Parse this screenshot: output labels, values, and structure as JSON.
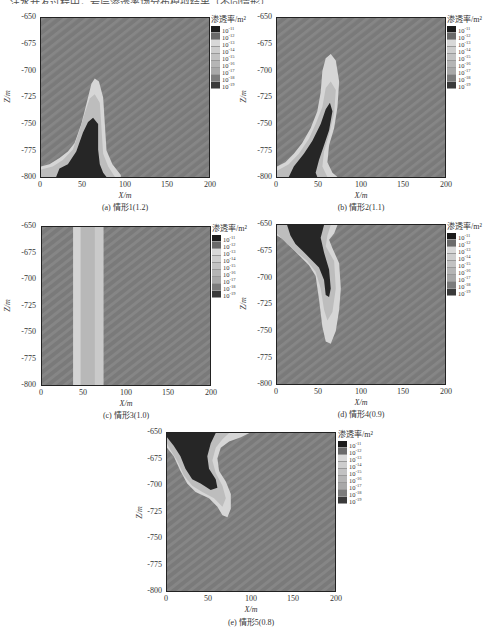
{
  "topline": "…注水开发过程中，岩层渗透率场分布模拟结果（不同情形）…",
  "legend": {
    "title": "渗透率/m²",
    "levels": [
      {
        "label": "10",
        "exp": "-11",
        "color": "#1c1c1c"
      },
      {
        "label": "10",
        "exp": "-12",
        "color": "#6a6a6a"
      },
      {
        "label": "10",
        "exp": "-13",
        "color": "#d8d8d8"
      },
      {
        "label": "10",
        "exp": "-14",
        "color": "#cdcdcd"
      },
      {
        "label": "10",
        "exp": "-15",
        "color": "#c2c2c2"
      },
      {
        "label": "10",
        "exp": "-16",
        "color": "#b5b5b5"
      },
      {
        "label": "10",
        "exp": "-17",
        "color": "#a8a8a8"
      },
      {
        "label": "10",
        "exp": "-18",
        "color": "#7c7c7c"
      },
      {
        "label": "10",
        "exp": "-19",
        "color": "#3a3a3a"
      }
    ]
  },
  "axes": {
    "xlabel": "X/m",
    "ylabel": "Z/m",
    "xticks": [
      "0",
      "50",
      "100",
      "150",
      "200"
    ],
    "yticks": [
      "-650",
      "-675",
      "-700",
      "-725",
      "-750",
      "-775",
      "-800"
    ]
  },
  "panels": [
    {
      "id": "a",
      "caption": "(a) 情形1(1.2)"
    },
    {
      "id": "b",
      "caption": "(b) 情形2(1.1)"
    },
    {
      "id": "c",
      "caption": "(c) 情形3(1.0)"
    },
    {
      "id": "d",
      "caption": "(d) 情形4(0.9)"
    },
    {
      "id": "e",
      "caption": "(e) 情形5(0.8)"
    }
  ],
  "chart_data": [
    {
      "type": "heatmap",
      "title": "(a) 情形1(1.2)",
      "xlabel": "X/m",
      "ylabel": "Z/m",
      "xlim": [
        0,
        200
      ],
      "ylim": [
        -800,
        -650
      ],
      "xticks": [
        0,
        50,
        100,
        150,
        200
      ],
      "yticks": [
        -650,
        -675,
        -700,
        -725,
        -750,
        -775,
        -800
      ],
      "colorbar": {
        "title": "渗透率/m²",
        "levels": [
          "1e-11",
          "1e-12",
          "1e-13",
          "1e-14",
          "1e-15",
          "1e-16",
          "1e-17",
          "1e-18",
          "1e-19"
        ]
      },
      "background_level": "1e-18",
      "features": "Plume rising from bottom-left (x≈0–95) to apex at x≈65, z≈-720; dark (1e-11) core x≈20–75 from z≈-745 to -800, light (1e-13..1e-15) halo"
    },
    {
      "type": "heatmap",
      "title": "(b) 情形2(1.1)",
      "xlabel": "X/m",
      "ylabel": "Z/m",
      "xlim": [
        0,
        200
      ],
      "ylim": [
        -800,
        -650
      ],
      "colorbar": {
        "title": "渗透率/m²"
      },
      "background_level": "1e-18",
      "features": "Taller plume from bottom-left, apex at x≈65, z≈-693; dark core x≈15–70 from z≈-735 to -800"
    },
    {
      "type": "heatmap",
      "title": "(c) 情形3(1.0)",
      "xlabel": "X/m",
      "ylabel": "Z/m",
      "xlim": [
        0,
        200
      ],
      "ylim": [
        -800,
        -650
      ],
      "colorbar": {
        "title": "渗透率/m²"
      },
      "background_level": "1e-18",
      "features": "Vertical band spanning full depth at x≈37–73; inner band x≈46–62 (1e-15), outer edges (1e-13)"
    },
    {
      "type": "heatmap",
      "title": "(d) 情形4(0.9)",
      "xlabel": "X/m",
      "ylabel": "Z/m",
      "xlim": [
        0,
        200
      ],
      "ylim": [
        -800,
        -650
      ],
      "colorbar": {
        "title": "渗透率/m²"
      },
      "background_level": "1e-18",
      "features": "Plume descending from top-left, bottom at x≈62, z≈-762; dark core x≈12–65 from z≈-650 to -718"
    },
    {
      "type": "heatmap",
      "title": "(e) 情形5(0.8)",
      "xlabel": "X/m",
      "ylabel": "Z/m",
      "xlim": [
        0,
        200
      ],
      "ylim": [
        -800,
        -650
      ],
      "colorbar": {
        "title": "渗透率/m²"
      },
      "background_level": "1e-18",
      "features": "Plume descending from top-left, bottom at x≈68, z≈-730; dark core x≈0–58 from z≈-650 to -705"
    }
  ]
}
